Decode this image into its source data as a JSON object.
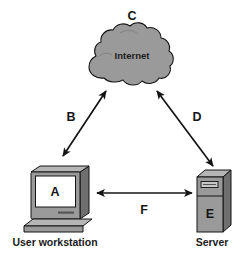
{
  "diagram": {
    "background_color": "#ffffff",
    "line_color": "#141414",
    "fill_gray": "#9a9a9a",
    "fill_gray_light": "#b5b5b5",
    "fill_gray_dark": "#6f6f6f",
    "screen_color": "#ffffff",
    "nodes": [
      {
        "id": "workstation",
        "label": "A",
        "caption": "User workstation",
        "icon": "desktop-computer-icon"
      },
      {
        "id": "internet",
        "label": "C",
        "caption": "Internet",
        "icon": "cloud-icon"
      },
      {
        "id": "server",
        "label": "E",
        "caption": "Server",
        "icon": "server-tower-icon"
      }
    ],
    "links": [
      {
        "id": "link-b",
        "label": "B",
        "from": "workstation",
        "to": "internet",
        "arrow": "double"
      },
      {
        "id": "link-d",
        "label": "D",
        "from": "internet",
        "to": "server",
        "arrow": "double"
      },
      {
        "id": "link-f",
        "label": "F",
        "from": "workstation",
        "to": "server",
        "arrow": "double"
      }
    ]
  }
}
